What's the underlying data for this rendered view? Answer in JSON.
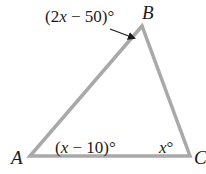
{
  "diagram": {
    "type": "triangle",
    "stroke_color": "#a9a9a9",
    "text_color": "#1a1a1a",
    "vertices": [
      {
        "name": "A",
        "label": "A",
        "x": 30,
        "y": 156
      },
      {
        "name": "B",
        "label": "B",
        "x": 142,
        "y": 26
      },
      {
        "name": "C",
        "label": "C",
        "x": 190,
        "y": 156
      }
    ],
    "angles": {
      "A": {
        "prefix": "(",
        "var": "x",
        "rest": " − 10)°"
      },
      "B": {
        "prefix": "(2",
        "var": "x",
        "rest": " − 50)°"
      },
      "C": {
        "var": "x",
        "rest": "°"
      }
    }
  }
}
